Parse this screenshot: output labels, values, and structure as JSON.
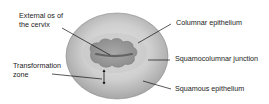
{
  "diagram": {
    "labels": {
      "external_os": [
        "External os of",
        "the cervix"
      ],
      "transformation_zone": [
        "Transformation",
        "zone"
      ],
      "columnar_epithelium": "Columnar epithelium",
      "squamocolumnar_junction": "Squamocolumnar junction",
      "squamous_epithelium": "Squamous epithelium"
    },
    "colors": {
      "cervix_outer": "#bdbdbd",
      "cervix_inner": "#9a9a9a",
      "columnar_region": "#8c8c8c",
      "os_slit": "#555555",
      "leader_line": "#111111"
    }
  }
}
